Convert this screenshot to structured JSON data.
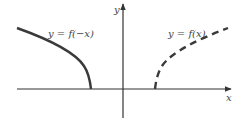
{
  "diagram": {
    "axes": {
      "x_label": "x",
      "y_label": "y"
    },
    "curves": [
      {
        "id": "reflected",
        "label": "y = f(−x)",
        "style": "solid",
        "color": "#3a3a3a"
      },
      {
        "id": "original",
        "label": "y = f(x)",
        "style": "dashed",
        "color": "#3a3a3a"
      }
    ],
    "axis_color": "#333333"
  }
}
